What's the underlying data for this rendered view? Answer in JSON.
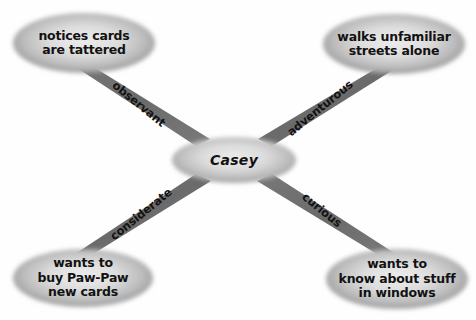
{
  "diagram": {
    "kind": "character-trait-web",
    "title_text": "Casey",
    "background_color": "#fefefe",
    "ellipse_edge_color": "#8e8e8e",
    "ellipse_center_color": "#e2e2e2",
    "band_color": "#6e6e6e",
    "text_color": "#121212",
    "center_node": {
      "id": "center",
      "lines": [
        "Casey"
      ],
      "cx": 234,
      "cy": 160,
      "rx": 62,
      "ry": 23
    },
    "outer_nodes": [
      {
        "id": "top-left",
        "lines": [
          "notices cards",
          "are tattered"
        ],
        "cx": 84,
        "cy": 43,
        "rx": 71,
        "ry": 30
      },
      {
        "id": "top-right",
        "lines": [
          "walks unfamiliar",
          "streets alone"
        ],
        "cx": 394,
        "cy": 44,
        "rx": 71,
        "ry": 30
      },
      {
        "id": "bottom-left",
        "lines": [
          "wants to",
          "buy Paw-Paw",
          "new cards"
        ],
        "cx": 83,
        "cy": 278,
        "rx": 70,
        "ry": 29
      },
      {
        "id": "bottom-right",
        "lines": [
          "wants to",
          "know about stuff",
          "in windows"
        ],
        "cx": 397,
        "cy": 279,
        "rx": 71,
        "ry": 30
      }
    ],
    "edges": [
      {
        "id": "edge-observant",
        "label": "observant",
        "from": "center",
        "to": "top-left",
        "label_x": 139,
        "label_y": 104,
        "label_rotation": 39
      },
      {
        "id": "edge-adventurous",
        "label": "adventurous",
        "from": "center",
        "to": "top-right",
        "label_x": 320,
        "label_y": 108,
        "label_rotation": -39
      },
      {
        "id": "edge-considerate",
        "label": "considerate",
        "from": "center",
        "to": "bottom-left",
        "label_x": 141,
        "label_y": 214,
        "label_rotation": -39
      },
      {
        "id": "edge-curious",
        "label": "curious",
        "from": "center",
        "to": "bottom-right",
        "label_x": 322,
        "label_y": 210,
        "label_rotation": 39
      }
    ]
  }
}
